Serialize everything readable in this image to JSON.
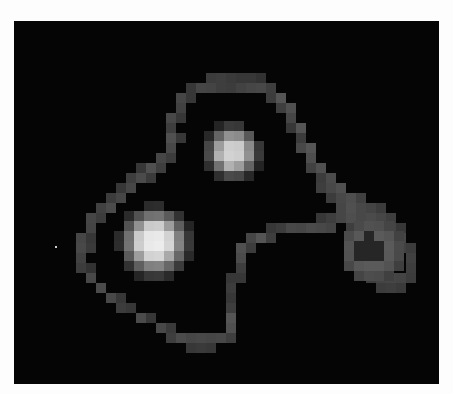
{
  "image": {
    "description": "Pixelated grayscale image: a looping bright track connecting two bright blobs and a faint ring-shaped lobe on a black background",
    "background": "#050505",
    "page_background": "#fdfdfd",
    "frame": {
      "x": 14,
      "y": 21,
      "width": 425,
      "height": 363
    },
    "cell_size": 10,
    "blobs": [
      {
        "name": "upper-blob",
        "cx": 233,
        "cy": 152,
        "r": 30,
        "peak": "#d8d8d8"
      },
      {
        "name": "lower-left-blob",
        "cx": 155,
        "cy": 242,
        "r": 38,
        "peak": "#f0f0f0"
      },
      {
        "name": "right-ring-lobe",
        "cx": 372,
        "cy": 250,
        "r": 32,
        "peak": "#6a6a6a"
      }
    ],
    "cells": [
      [
        19,
        5,
        60
      ],
      [
        20,
        5,
        62
      ],
      [
        21,
        5,
        58
      ],
      [
        22,
        5,
        55
      ],
      [
        23,
        5,
        55
      ],
      [
        24,
        5,
        50
      ],
      [
        17,
        6,
        55
      ],
      [
        18,
        6,
        70
      ],
      [
        19,
        6,
        68
      ],
      [
        20,
        6,
        62
      ],
      [
        21,
        6,
        60
      ],
      [
        22,
        6,
        66
      ],
      [
        23,
        6,
        70
      ],
      [
        24,
        6,
        72
      ],
      [
        25,
        6,
        62
      ],
      [
        16,
        7,
        70
      ],
      [
        17,
        7,
        55
      ],
      [
        25,
        7,
        60
      ],
      [
        26,
        7,
        85
      ],
      [
        16,
        8,
        65
      ],
      [
        26,
        8,
        62
      ],
      [
        27,
        8,
        80
      ],
      [
        15,
        9,
        72
      ],
      [
        16,
        9,
        55
      ],
      [
        27,
        9,
        70
      ],
      [
        15,
        10,
        62
      ],
      [
        27,
        10,
        55
      ],
      [
        28,
        10,
        85
      ],
      [
        15,
        11,
        80
      ],
      [
        16,
        11,
        55
      ],
      [
        28,
        11,
        60
      ],
      [
        15,
        12,
        72
      ],
      [
        28,
        12,
        72
      ],
      [
        29,
        12,
        85
      ],
      [
        14,
        13,
        70
      ],
      [
        15,
        13,
        60
      ],
      [
        29,
        13,
        78
      ],
      [
        12,
        14,
        55
      ],
      [
        13,
        14,
        80
      ],
      [
        14,
        14,
        62
      ],
      [
        29,
        14,
        65
      ],
      [
        30,
        14,
        80
      ],
      [
        11,
        15,
        62
      ],
      [
        12,
        15,
        75
      ],
      [
        13,
        15,
        58
      ],
      [
        30,
        15,
        60
      ],
      [
        31,
        15,
        75
      ],
      [
        10,
        16,
        55
      ],
      [
        11,
        16,
        70
      ],
      [
        30,
        16,
        62
      ],
      [
        31,
        16,
        72
      ],
      [
        32,
        16,
        80
      ],
      [
        9,
        17,
        60
      ],
      [
        10,
        17,
        70
      ],
      [
        31,
        17,
        60
      ],
      [
        32,
        17,
        72
      ],
      [
        33,
        17,
        78
      ],
      [
        34,
        17,
        65
      ],
      [
        8,
        18,
        65
      ],
      [
        9,
        18,
        75
      ],
      [
        32,
        18,
        70
      ],
      [
        33,
        18,
        80
      ],
      [
        34,
        18,
        72
      ],
      [
        35,
        18,
        68
      ],
      [
        36,
        18,
        60
      ],
      [
        7,
        19,
        70
      ],
      [
        8,
        19,
        60
      ],
      [
        30,
        19,
        55
      ],
      [
        31,
        19,
        62
      ],
      [
        32,
        19,
        70
      ],
      [
        33,
        19,
        78
      ],
      [
        34,
        19,
        72
      ],
      [
        35,
        19,
        75
      ],
      [
        36,
        19,
        70
      ],
      [
        37,
        19,
        62
      ],
      [
        7,
        20,
        68
      ],
      [
        25,
        20,
        55
      ],
      [
        26,
        20,
        60
      ],
      [
        27,
        20,
        72
      ],
      [
        28,
        20,
        70
      ],
      [
        29,
        20,
        75
      ],
      [
        30,
        20,
        72
      ],
      [
        31,
        20,
        68
      ],
      [
        33,
        20,
        62
      ],
      [
        34,
        20,
        70
      ],
      [
        35,
        20,
        65
      ],
      [
        36,
        20,
        60
      ],
      [
        37,
        20,
        68
      ],
      [
        38,
        20,
        55
      ],
      [
        6,
        21,
        70
      ],
      [
        7,
        21,
        55
      ],
      [
        23,
        21,
        70
      ],
      [
        24,
        21,
        85
      ],
      [
        25,
        21,
        62
      ],
      [
        33,
        21,
        60
      ],
      [
        34,
        21,
        62
      ],
      [
        38,
        21,
        70
      ],
      [
        6,
        22,
        72
      ],
      [
        7,
        22,
        58
      ],
      [
        22,
        22,
        80
      ],
      [
        23,
        22,
        60
      ],
      [
        34,
        22,
        68
      ],
      [
        38,
        22,
        65
      ],
      [
        39,
        22,
        60
      ],
      [
        6,
        23,
        65
      ],
      [
        22,
        23,
        75
      ],
      [
        34,
        23,
        62
      ],
      [
        35,
        23,
        55
      ],
      [
        39,
        23,
        65
      ],
      [
        6,
        24,
        60
      ],
      [
        7,
        24,
        50
      ],
      [
        22,
        24,
        62
      ],
      [
        35,
        24,
        70
      ],
      [
        36,
        24,
        58
      ],
      [
        39,
        24,
        62
      ],
      [
        7,
        25,
        72
      ],
      [
        21,
        25,
        55
      ],
      [
        22,
        25,
        55
      ],
      [
        35,
        25,
        62
      ],
      [
        36,
        25,
        68
      ],
      [
        37,
        25,
        70
      ],
      [
        38,
        25,
        68
      ],
      [
        39,
        25,
        60
      ],
      [
        8,
        26,
        75
      ],
      [
        21,
        26,
        60
      ],
      [
        36,
        26,
        60
      ],
      [
        37,
        26,
        62
      ],
      [
        38,
        26,
        58
      ],
      [
        9,
        27,
        72
      ],
      [
        10,
        27,
        55
      ],
      [
        21,
        27,
        55
      ],
      [
        10,
        28,
        60
      ],
      [
        11,
        28,
        55
      ],
      [
        21,
        28,
        62
      ],
      [
        12,
        29,
        75
      ],
      [
        13,
        29,
        55
      ],
      [
        21,
        29,
        85
      ],
      [
        14,
        30,
        72
      ],
      [
        15,
        30,
        58
      ],
      [
        21,
        30,
        80
      ],
      [
        15,
        31,
        62
      ],
      [
        16,
        31,
        75
      ],
      [
        17,
        31,
        70
      ],
      [
        18,
        31,
        72
      ],
      [
        19,
        31,
        70
      ],
      [
        20,
        31,
        72
      ],
      [
        21,
        31,
        62
      ],
      [
        17,
        32,
        55
      ],
      [
        18,
        32,
        58
      ],
      [
        19,
        32,
        55
      ]
    ]
  }
}
